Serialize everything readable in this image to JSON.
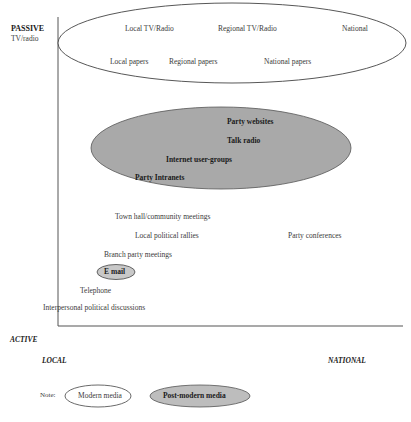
{
  "axes": {
    "y_top_label": "PASSIVE",
    "y_top_sublabel": "TV/radio",
    "y_bottom_label": "ACTIVE",
    "x_left_label": "LOCAL",
    "x_right_label": "NATIONAL"
  },
  "modern_media": [
    {
      "label": "Local TV/Radio"
    },
    {
      "label": "Regional TV/Radio"
    },
    {
      "label": "National"
    },
    {
      "label": "Local papers"
    },
    {
      "label": "Regional papers"
    },
    {
      "label": "National papers"
    }
  ],
  "postmodern_media": [
    {
      "label": "Party websites"
    },
    {
      "label": "Talk radio"
    },
    {
      "label": "Internet user-groups"
    },
    {
      "label": "Party Intranets"
    }
  ],
  "interpersonal": [
    {
      "label": "Town hall/community meetings"
    },
    {
      "label": "Local political rallies"
    },
    {
      "label": "Party conferences"
    },
    {
      "label": "Branch party meetings"
    },
    {
      "label": "E mail"
    },
    {
      "label": "Telephone"
    },
    {
      "label": "Interpersonal political discussions"
    }
  ],
  "legend": {
    "note": "Note:",
    "modern": "Modern media",
    "postmodern": "Post-modern media"
  },
  "colors": {
    "postmodern_fill": "#a9a9a9",
    "email_fill": "#c8c8c8",
    "legend_postmodern_fill": "#bdbdbd",
    "line": "#444444"
  }
}
